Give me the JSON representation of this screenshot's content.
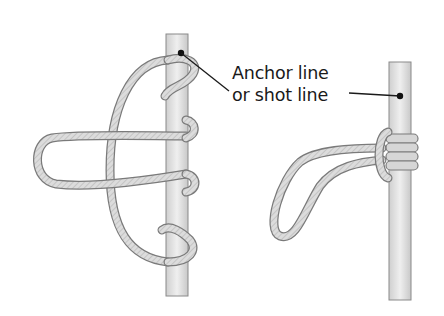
{
  "diagram": {
    "type": "knot-illustration",
    "label": {
      "line1": "Anchor line",
      "line2": "or shot line"
    },
    "figures": [
      {
        "id": "left",
        "description": "loosely tied knot wrapped around vertical line with loop extending left"
      },
      {
        "id": "right",
        "description": "finished knot with tight wraps around vertical line and loop hanging left"
      }
    ],
    "colors": {
      "background": "#ffffff",
      "rope": "#d9d9d9",
      "rope_outline": "#7a7a7a",
      "line_fill": "#e6e6e6",
      "line_outline": "#8a8a8a",
      "leader": "#1a1a1a"
    }
  }
}
